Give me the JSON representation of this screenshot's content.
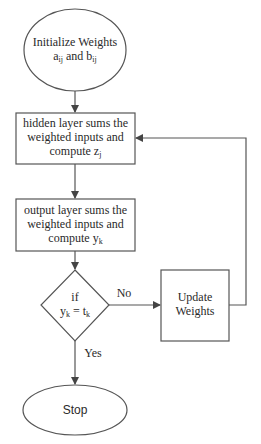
{
  "diagram": {
    "type": "flowchart",
    "colors": {
      "stroke": "#555555",
      "text": "#2a2a2a",
      "background": "#ffffff"
    },
    "nodes": {
      "start": {
        "shape": "ellipse",
        "line1": "Initialize Weights",
        "line2_a": "a",
        "line2_a_sub": "ij",
        "line2_and": " and ",
        "line2_b": "b",
        "line2_b_sub": "ij"
      },
      "hidden": {
        "shape": "rectangle",
        "line1": "hidden layer sums the",
        "line2": "weighted inputs and",
        "line3": "compute z",
        "line3_sub": "j"
      },
      "output": {
        "shape": "rectangle",
        "line1": "output layer sums the",
        "line2": "weighted inputs and",
        "line3": "compute y",
        "line3_sub": "k"
      },
      "decision": {
        "shape": "diamond",
        "line1": "if",
        "line2_y": "y",
        "line2_y_sub": "k",
        "line2_eq": " = t",
        "line2_t_sub": "k"
      },
      "update": {
        "shape": "rectangle",
        "line1": "Update",
        "line2": "Weights"
      },
      "stop": {
        "shape": "ellipse",
        "label": "Stop"
      }
    },
    "edges": {
      "no_label": "No",
      "yes_label": "Yes"
    }
  }
}
